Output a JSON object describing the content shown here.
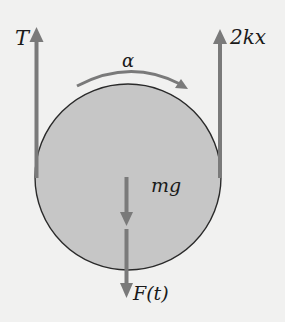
{
  "diagram": {
    "colors": {
      "background": "#f1f1f0",
      "disk_fill": "#c6c6c6",
      "disk_outline": "#2a2a2a",
      "force_arrow": "#7a7a7a",
      "label": "#1a1a1a"
    },
    "labels": {
      "tension": "T",
      "spring_force": "2kx",
      "angular_acceleration": "α",
      "weight": "mg",
      "applied_force": "F(t)"
    },
    "elements": [
      {
        "id": "disk",
        "type": "circle",
        "label": ""
      },
      {
        "id": "tension-arrow",
        "type": "arrow",
        "direction": "up",
        "label": "T",
        "position": "left tangent"
      },
      {
        "id": "spring-force-arrow",
        "type": "arrow",
        "direction": "up",
        "label": "2kx",
        "position": "right tangent"
      },
      {
        "id": "angular-acceleration-arc",
        "type": "curved-arrow",
        "direction": "clockwise",
        "label": "α"
      },
      {
        "id": "weight-arrow",
        "type": "arrow",
        "direction": "down",
        "label": "mg",
        "position": "center"
      },
      {
        "id": "applied-force-arrow",
        "type": "arrow",
        "direction": "down",
        "label": "F(t)",
        "position": "bottom"
      }
    ]
  }
}
